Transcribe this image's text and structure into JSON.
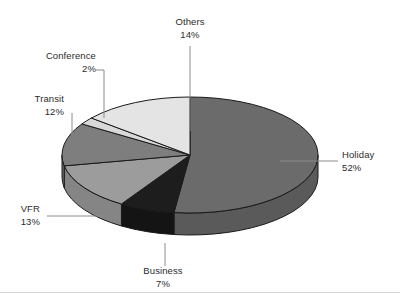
{
  "chart_data": {
    "type": "pie",
    "title": "",
    "subtitle": "",
    "xlabel": "",
    "ylabel": "",
    "legend_position": "none",
    "grid": false,
    "style": "3d-exploded-none",
    "units": "percent",
    "start_angle_deg": 0,
    "direction": "clockwise",
    "categories": [
      "Holiday",
      "Business",
      "VFR",
      "Transit",
      "Conference",
      "Others"
    ],
    "values": [
      52,
      7,
      13,
      12,
      2,
      14
    ],
    "labels": [
      "52%",
      "7%",
      "13%",
      "12%",
      "2%",
      "14%"
    ],
    "colors": [
      "#6b6b6b",
      "#1d1d1d",
      "#9c9c9c",
      "#7e7e7e",
      "#d9d9d9",
      "#e4e4e4"
    ],
    "slices": [
      {
        "name": "Holiday",
        "value": 52,
        "label": "52%",
        "color": "#6b6b6b",
        "side_color": "#5a5a5a"
      },
      {
        "name": "Business",
        "value": 7,
        "label": "7%",
        "color": "#1d1d1d",
        "side_color": "#141414"
      },
      {
        "name": "VFR",
        "value": 13,
        "label": "13%",
        "color": "#9c9c9c",
        "side_color": "#858585"
      },
      {
        "name": "Transit",
        "value": 12,
        "label": "12%",
        "color": "#7e7e7e",
        "side_color": "#6a6a6a"
      },
      {
        "name": "Conference",
        "value": 2,
        "label": "2%",
        "color": "#d9d9d9",
        "side_color": "#bdbdbd"
      },
      {
        "name": "Others",
        "value": 14,
        "label": "14%",
        "color": "#e4e4e4",
        "side_color": "#c8c8c8"
      }
    ]
  },
  "labels": {
    "others": {
      "name": "Others",
      "percent": "14%"
    },
    "conference": {
      "name": "Conference",
      "percent": "2%"
    },
    "transit": {
      "name": "Transit",
      "percent": "12%"
    },
    "vfr": {
      "name": "VFR",
      "percent": "13%"
    },
    "business": {
      "name": "Business",
      "percent": "7%"
    },
    "holiday": {
      "name": "Holiday",
      "percent": "52%"
    }
  },
  "colors": {
    "background": "#ffffff",
    "outline": "#1a1a1a",
    "leader_line": "#8c8c8c",
    "text": "#2b2b2b",
    "footer_rule": "#d7d7d7"
  }
}
